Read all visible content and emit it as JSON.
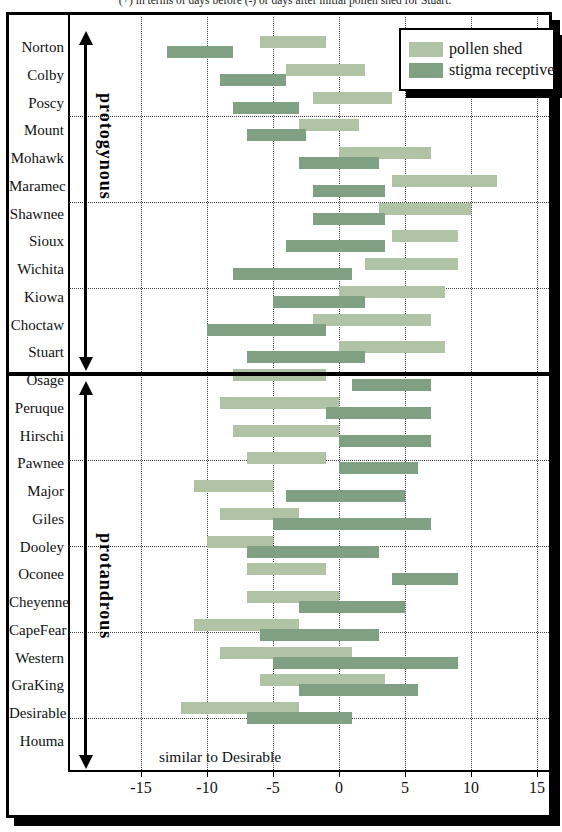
{
  "caption": "(+) in terms of days before (-) or days after initial pollen shed for Stuart.",
  "annotation": "similar to Desirable",
  "chart_data": {
    "type": "bar",
    "subtype": "horizontal-range-gantt",
    "title": "",
    "xlabel": "days relative to Stuart initial pollen shed",
    "x_ticks": [
      -15,
      -10,
      -5,
      0,
      5,
      10,
      15
    ],
    "xlim": [
      -20.5,
      16
    ],
    "grid": true,
    "legend_position": "top-right",
    "legend": [
      {
        "label": "pollen shed",
        "color": "#b0c3a4"
      },
      {
        "label": "stigma receptive",
        "color": "#7fa083"
      }
    ],
    "groups": [
      {
        "name": "protogynous",
        "cultivars": [
          {
            "name": "Norton",
            "pollen_shed": [
              -6,
              -1
            ],
            "stigma_receptive": [
              -13,
              -8
            ]
          },
          {
            "name": "Colby",
            "pollen_shed": [
              -4,
              2
            ],
            "stigma_receptive": [
              -9,
              -4
            ]
          },
          {
            "name": "Poscy",
            "pollen_shed": [
              -2,
              4
            ],
            "stigma_receptive": [
              -8,
              -3
            ]
          },
          {
            "name": "Mount",
            "pollen_shed": [
              -3,
              1.5
            ],
            "stigma_receptive": [
              -7,
              -2.5
            ]
          },
          {
            "name": "Mohawk",
            "pollen_shed": [
              0,
              7
            ],
            "stigma_receptive": [
              -3,
              3
            ]
          },
          {
            "name": "Maramec",
            "pollen_shed": [
              4,
              12
            ],
            "stigma_receptive": [
              -2,
              3.5
            ]
          },
          {
            "name": "Shawnee",
            "pollen_shed": [
              3,
              10
            ],
            "stigma_receptive": [
              -2,
              3.5
            ]
          },
          {
            "name": "Sioux",
            "pollen_shed": [
              4,
              9
            ],
            "stigma_receptive": [
              -4,
              3.5
            ]
          },
          {
            "name": "Wichita",
            "pollen_shed": [
              2,
              9
            ],
            "stigma_receptive": [
              -8,
              1
            ]
          },
          {
            "name": "Kiowa",
            "pollen_shed": [
              0,
              8
            ],
            "stigma_receptive": [
              -5,
              2
            ]
          },
          {
            "name": "Choctaw",
            "pollen_shed": [
              -2,
              7
            ],
            "stigma_receptive": [
              -10,
              -1
            ]
          },
          {
            "name": "Stuart",
            "pollen_shed": [
              0,
              8
            ],
            "stigma_receptive": [
              -7,
              2
            ]
          }
        ]
      },
      {
        "name": "protandrous",
        "cultivars": [
          {
            "name": "Osage",
            "pollen_shed": [
              -8,
              -1
            ],
            "stigma_receptive": [
              1,
              7
            ]
          },
          {
            "name": "Peruque",
            "pollen_shed": [
              -9,
              0
            ],
            "stigma_receptive": [
              -1,
              7
            ]
          },
          {
            "name": "Hirschi",
            "pollen_shed": [
              -8,
              0
            ],
            "stigma_receptive": [
              0,
              7
            ]
          },
          {
            "name": "Pawnee",
            "pollen_shed": [
              -7,
              -1
            ],
            "stigma_receptive": [
              0,
              6
            ]
          },
          {
            "name": "Major",
            "pollen_shed": [
              -11,
              -5
            ],
            "stigma_receptive": [
              -4,
              5
            ]
          },
          {
            "name": "Giles",
            "pollen_shed": [
              -9,
              -3
            ],
            "stigma_receptive": [
              -5,
              7
            ]
          },
          {
            "name": "Dooley",
            "pollen_shed": [
              -10,
              -5
            ],
            "stigma_receptive": [
              -7,
              3
            ]
          },
          {
            "name": "Oconee",
            "pollen_shed": [
              -7,
              -1
            ],
            "stigma_receptive": [
              4,
              9
            ]
          },
          {
            "name": "Cheyenne",
            "pollen_shed": [
              -7,
              0
            ],
            "stigma_receptive": [
              -3,
              5
            ]
          },
          {
            "name": "CapeFear",
            "pollen_shed": [
              -11,
              -3
            ],
            "stigma_receptive": [
              -6,
              3
            ]
          },
          {
            "name": "Western",
            "pollen_shed": [
              -9,
              1
            ],
            "stigma_receptive": [
              -5,
              9
            ]
          },
          {
            "name": "GraKing",
            "pollen_shed": [
              -6,
              3.5
            ],
            "stigma_receptive": [
              -3,
              6
            ]
          },
          {
            "name": "Desirable",
            "pollen_shed": [
              -12,
              -3
            ],
            "stigma_receptive": [
              -7,
              1
            ]
          },
          {
            "name": "Houma",
            "pollen_shed": null,
            "stigma_receptive": null,
            "note": "similar to Desirable"
          }
        ]
      }
    ]
  }
}
